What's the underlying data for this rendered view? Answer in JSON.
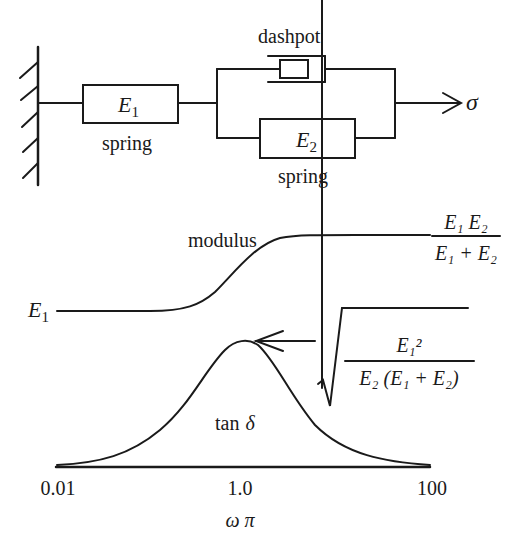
{
  "mechanical_model": {
    "spring1": {
      "symbol": "E",
      "subscript": "1",
      "label": "spring"
    },
    "dashpot": {
      "label": "dashpot"
    },
    "spring2": {
      "symbol": "E",
      "subscript": "2",
      "label": "spring"
    },
    "stress_symbol": "σ"
  },
  "response_plot": {
    "modulus_label": "modulus",
    "modulus_low": {
      "symbol": "E",
      "subscript": "1"
    },
    "modulus_high": {
      "numerator": "E₁ E₂",
      "denominator": "E₁ + E₂"
    },
    "loss_label_text": "tan",
    "loss_label_symbol": "δ",
    "peak_value": {
      "numerator": "E₁²",
      "denominator": "E₂ (E₁ + E₂)",
      "root": "√"
    },
    "x_ticks": [
      "0.01",
      "1.0",
      "100"
    ],
    "x_axis_label": "ω π"
  },
  "colors": {
    "ink": "#1a1a1a",
    "background": "#ffffff"
  }
}
